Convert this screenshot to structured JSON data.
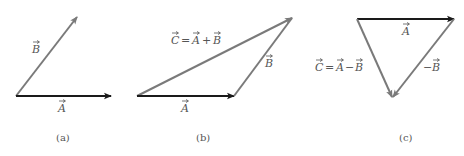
{
  "colors": {
    "vector_A": "#1a1a1a",
    "vector_B": "#7a7a7a",
    "vector_C": "#7a7a7a",
    "label": "#555555"
  },
  "panels": [
    {
      "id": "a",
      "caption": "(a)",
      "vectors": [
        {
          "name": "A",
          "label": "A",
          "kind": "primary"
        },
        {
          "name": "B",
          "label": "B",
          "kind": "secondary"
        }
      ]
    },
    {
      "id": "b",
      "caption": "(b)",
      "equation": {
        "lhs": "C",
        "op": "+",
        "a": "A",
        "b": "B",
        "text": "C = A + B"
      },
      "vectors": [
        {
          "name": "A",
          "label": "A",
          "kind": "primary"
        },
        {
          "name": "B",
          "label": "B",
          "kind": "secondary"
        },
        {
          "name": "C",
          "label": "C = A + B",
          "kind": "secondary"
        }
      ]
    },
    {
      "id": "c",
      "caption": "(c)",
      "equation": {
        "lhs": "C",
        "op": "−",
        "a": "A",
        "b": "B",
        "text": "C = A − B"
      },
      "vectors": [
        {
          "name": "A",
          "label": "A",
          "kind": "primary"
        },
        {
          "name": "-B",
          "label": "−B",
          "kind": "secondary"
        },
        {
          "name": "C",
          "label": "C = A − B",
          "kind": "secondary"
        }
      ]
    }
  ],
  "labels": {
    "a_B": "B",
    "a_A": "A",
    "b_C": "C",
    "b_eq": "=",
    "b_A1": "A",
    "b_plus": "+",
    "b_B1": "B",
    "b_B": "B",
    "b_A": "A",
    "c_A": "A",
    "c_C": "C",
    "c_eq": "=",
    "c_A1": "A",
    "c_minus": "−",
    "c_B1": "B",
    "c_negB_sign": "−",
    "c_negB": "B",
    "cap_a": "(a)",
    "cap_b": "(b)",
    "cap_c": "(c)"
  }
}
